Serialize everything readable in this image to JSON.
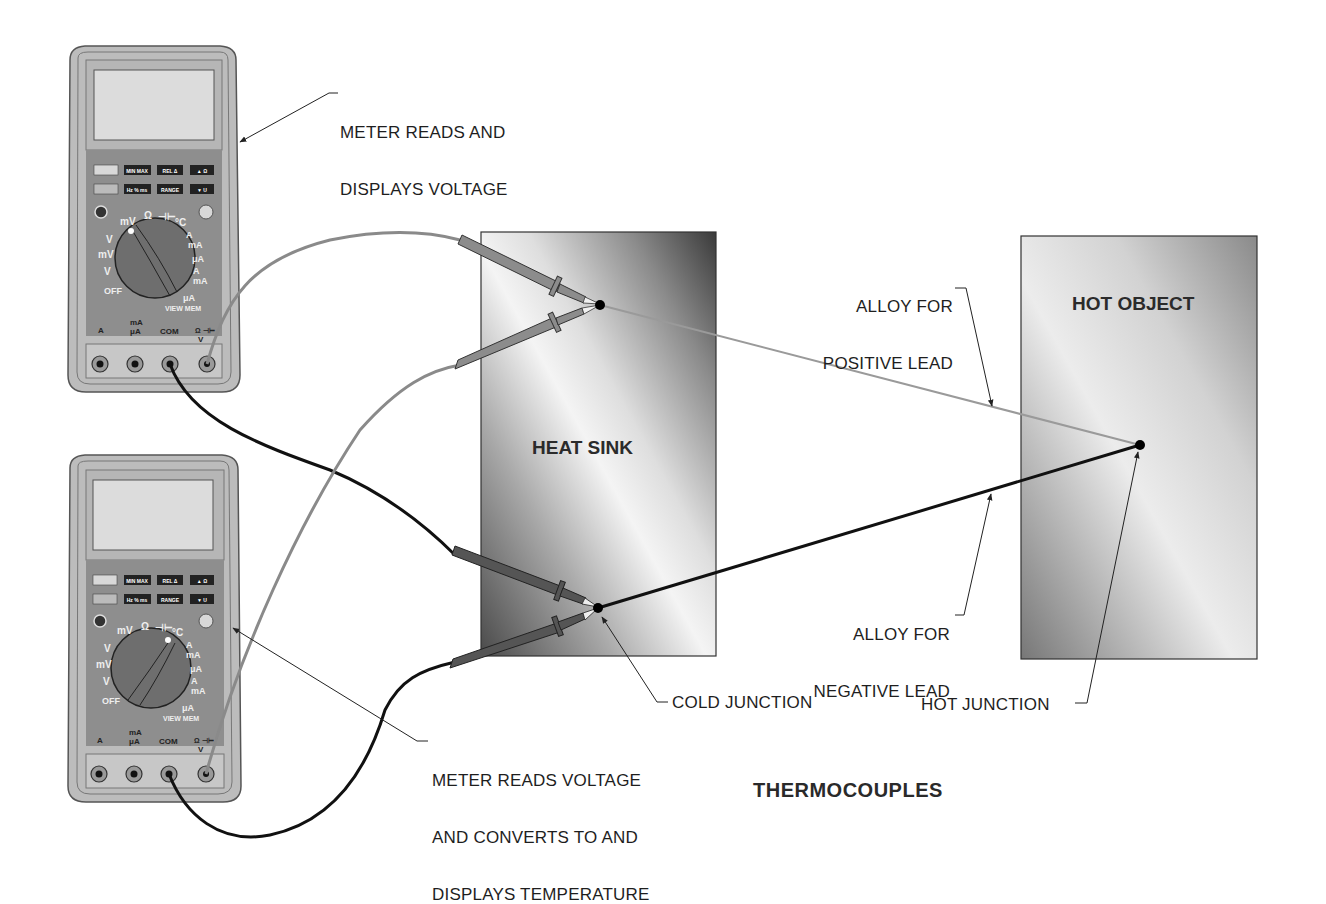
{
  "figure": {
    "title": "THERMOCOUPLES"
  },
  "objects": {
    "heat_sink": {
      "label": "HEAT SINK"
    },
    "hot_object": {
      "label": "HOT OBJECT"
    }
  },
  "callouts": {
    "meter_top": {
      "line1": "METER READS AND",
      "line2": "DISPLAYS VOLTAGE"
    },
    "meter_bottom": {
      "line1": "METER READS VOLTAGE",
      "line2": "AND CONVERTS TO AND",
      "line3": "DISPLAYS TEMPERATURE"
    },
    "positive_lead": {
      "line1": "ALLOY FOR",
      "line2": "POSITIVE LEAD"
    },
    "negative_lead": {
      "line1": "ALLOY FOR",
      "line2": "NEGATIVE LEAD"
    },
    "cold_junction": {
      "label": "COLD JUNCTION"
    },
    "hot_junction": {
      "label": "HOT JUNCTION"
    }
  },
  "meter": {
    "buttons_row1": [
      "HOLD",
      "MIN MAX",
      "REL Δ",
      "▲ Ω"
    ],
    "buttons_row2": [
      "",
      "Hz % ms",
      "RANGE",
      "▼ U"
    ],
    "dial_left": [
      "mV",
      "V",
      "mV",
      "V",
      "OFF"
    ],
    "dial_top": [
      "Ω",
      "⊣⊢",
      "°C",
      "°F"
    ],
    "dial_right": [
      "A",
      "mA",
      "μA",
      "A",
      "mA",
      "μA"
    ],
    "view_mem": "VIEW MEM",
    "clear_mem": "CLEAR MEM",
    "jacks": [
      "A",
      "mA μA",
      "COM",
      "V"
    ],
    "jack_top_right": "Ω ⊣⊢",
    "temperature": "TEMPERATURE"
  },
  "colors": {
    "meter_body": "#8f8f8f",
    "meter_bezel": "#bdbdbd",
    "meter_screen": "#dadada",
    "positive_wire": "#8a8a8a",
    "negative_wire": "#111111",
    "probe_gray": "#8c8c8c",
    "probe_dark": "#555555",
    "line": "#222222"
  }
}
